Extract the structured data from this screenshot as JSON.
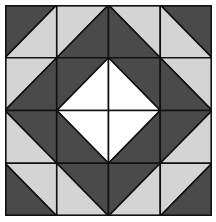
{
  "grid": {
    "rows": 4,
    "cols": 4
  },
  "colors": {
    "dark": "#4a4a4a",
    "light": "#d4d4d4",
    "white": "#ffffff",
    "line": "#111111"
  },
  "cells": [
    [
      {
        "diag": "/",
        "a": "dark",
        "b": "light"
      },
      {
        "diag": "/",
        "a": "light",
        "b": "dark"
      },
      {
        "diag": "\\",
        "a": "light",
        "b": "dark"
      },
      {
        "diag": "\\",
        "a": "dark",
        "b": "light"
      }
    ],
    [
      {
        "diag": "/",
        "a": "light",
        "b": "dark"
      },
      {
        "diag": "/",
        "a": "dark",
        "b": "white"
      },
      {
        "diag": "\\",
        "a": "dark",
        "b": "white"
      },
      {
        "diag": "\\",
        "a": "light",
        "b": "dark"
      }
    ],
    [
      {
        "diag": "\\",
        "a": "dark",
        "b": "light"
      },
      {
        "diag": "\\",
        "a": "white",
        "b": "dark"
      },
      {
        "diag": "/",
        "a": "white",
        "b": "dark"
      },
      {
        "diag": "/",
        "a": "dark",
        "b": "light"
      }
    ],
    [
      {
        "diag": "\\",
        "a": "light",
        "b": "dark"
      },
      {
        "diag": "\\",
        "a": "dark",
        "b": "light"
      },
      {
        "diag": "/",
        "a": "dark",
        "b": "light"
      },
      {
        "diag": "/",
        "a": "light",
        "b": "dark"
      }
    ]
  ]
}
